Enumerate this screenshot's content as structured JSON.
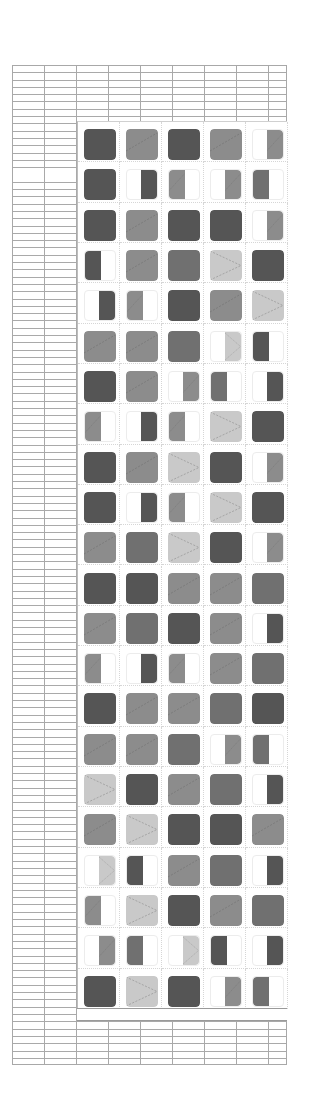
{
  "drawing": {
    "title": "Facade elevation",
    "wall": {
      "material": "brick",
      "stroke_color": "#a9a9a9"
    },
    "panel": {
      "columns": 5,
      "rows": 22
    },
    "shades": {
      "D": "#555555",
      "MD": "#707070",
      "M": "#8c8c8c",
      "L": "#c9c9c9"
    },
    "windows": [
      [
        [
          "full",
          "D"
        ],
        [
          "full",
          "M"
        ],
        [
          "full",
          "D"
        ],
        [
          "full",
          "M"
        ],
        [
          "half-right",
          "M"
        ]
      ],
      [
        [
          "full",
          "D"
        ],
        [
          "half-right",
          "D"
        ],
        [
          "half-left",
          "M"
        ],
        [
          "half-right",
          "M"
        ],
        [
          "half-left",
          "MD"
        ]
      ],
      [
        [
          "full",
          "D"
        ],
        [
          "full",
          "M"
        ],
        [
          "full",
          "D"
        ],
        [
          "full",
          "D"
        ],
        [
          "half-right",
          "M"
        ]
      ],
      [
        [
          "half-left",
          "D"
        ],
        [
          "full",
          "M"
        ],
        [
          "full",
          "MD"
        ],
        [
          "full",
          "L"
        ],
        [
          "full",
          "D"
        ]
      ],
      [
        [
          "half-right",
          "D"
        ],
        [
          "half-left",
          "M"
        ],
        [
          "full",
          "D"
        ],
        [
          "full",
          "M"
        ],
        [
          "full",
          "L"
        ]
      ],
      [
        [
          "full",
          "M"
        ],
        [
          "full",
          "M"
        ],
        [
          "full",
          "MD"
        ],
        [
          "half-right",
          "L"
        ],
        [
          "half-left",
          "D"
        ]
      ],
      [
        [
          "full",
          "D"
        ],
        [
          "full",
          "M"
        ],
        [
          "half-right",
          "M"
        ],
        [
          "half-left",
          "MD"
        ],
        [
          "half-right",
          "D"
        ]
      ],
      [
        [
          "half-left",
          "M"
        ],
        [
          "half-right",
          "D"
        ],
        [
          "half-left",
          "M"
        ],
        [
          "full",
          "L"
        ],
        [
          "full",
          "D"
        ]
      ],
      [
        [
          "full",
          "D"
        ],
        [
          "full",
          "M"
        ],
        [
          "full",
          "L"
        ],
        [
          "full",
          "D"
        ],
        [
          "half-right",
          "M"
        ]
      ],
      [
        [
          "full",
          "D"
        ],
        [
          "half-right",
          "D"
        ],
        [
          "half-left",
          "M"
        ],
        [
          "full",
          "L"
        ],
        [
          "full",
          "D"
        ]
      ],
      [
        [
          "full",
          "M"
        ],
        [
          "full",
          "MD"
        ],
        [
          "full",
          "L"
        ],
        [
          "full",
          "D"
        ],
        [
          "half-right",
          "M"
        ]
      ],
      [
        [
          "full",
          "D"
        ],
        [
          "full",
          "D"
        ],
        [
          "full",
          "M"
        ],
        [
          "full",
          "M"
        ],
        [
          "full",
          "MD"
        ]
      ],
      [
        [
          "full",
          "M"
        ],
        [
          "full",
          "MD"
        ],
        [
          "full",
          "D"
        ],
        [
          "full",
          "M"
        ],
        [
          "half-right",
          "D"
        ]
      ],
      [
        [
          "half-left",
          "M"
        ],
        [
          "half-right",
          "D"
        ],
        [
          "half-left",
          "M"
        ],
        [
          "full",
          "M"
        ],
        [
          "full",
          "MD"
        ]
      ],
      [
        [
          "full",
          "D"
        ],
        [
          "full",
          "M"
        ],
        [
          "full",
          "M"
        ],
        [
          "full",
          "MD"
        ],
        [
          "full",
          "D"
        ]
      ],
      [
        [
          "full",
          "M"
        ],
        [
          "full",
          "M"
        ],
        [
          "full",
          "MD"
        ],
        [
          "half-right",
          "M"
        ],
        [
          "half-left",
          "MD"
        ]
      ],
      [
        [
          "full",
          "L"
        ],
        [
          "full",
          "D"
        ],
        [
          "full",
          "M"
        ],
        [
          "full",
          "MD"
        ],
        [
          "half-right",
          "D"
        ]
      ],
      [
        [
          "full",
          "M"
        ],
        [
          "full",
          "L"
        ],
        [
          "full",
          "D"
        ],
        [
          "full",
          "D"
        ],
        [
          "full",
          "M"
        ]
      ],
      [
        [
          "half-right",
          "L"
        ],
        [
          "half-left",
          "D"
        ],
        [
          "full",
          "M"
        ],
        [
          "full",
          "MD"
        ],
        [
          "half-right",
          "D"
        ]
      ],
      [
        [
          "half-left",
          "M"
        ],
        [
          "full",
          "L"
        ],
        [
          "full",
          "D"
        ],
        [
          "full",
          "M"
        ],
        [
          "full",
          "MD"
        ]
      ],
      [
        [
          "half-right",
          "M"
        ],
        [
          "half-left",
          "MD"
        ],
        [
          "half-right",
          "L"
        ],
        [
          "half-left",
          "D"
        ],
        [
          "half-right",
          "D"
        ]
      ],
      [
        [
          "full",
          "D"
        ],
        [
          "full",
          "L"
        ],
        [
          "full",
          "D"
        ],
        [
          "half-right",
          "M"
        ],
        [
          "half-left",
          "MD"
        ]
      ]
    ]
  }
}
